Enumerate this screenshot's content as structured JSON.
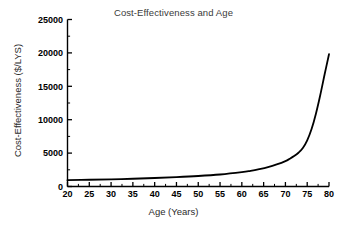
{
  "chart_data": {
    "type": "line",
    "title": "Cost-Effectiveness and Age",
    "xlabel": "Age (Years)",
    "ylabel": "Cost-Effectiveness ($/LYS)",
    "xlim": [
      20,
      80
    ],
    "ylim": [
      0,
      25000
    ],
    "xticks": [
      20,
      25,
      30,
      35,
      40,
      45,
      50,
      55,
      60,
      65,
      70,
      75,
      80
    ],
    "xtick_labels": [
      "20",
      "25",
      "30",
      "35",
      "40",
      "45",
      "50",
      "55",
      "60",
      "65",
      "70",
      "75",
      "80"
    ],
    "yticks": [
      0,
      5000,
      10000,
      15000,
      20000,
      25000
    ],
    "ytick_labels": [
      "0",
      "5000",
      "10000",
      "15000",
      "20000",
      "25000"
    ],
    "x_minor_interval": 2.5,
    "y_minor_interval": 2500,
    "grid": false,
    "legend": null,
    "spines": [
      "left",
      "bottom"
    ],
    "tick_direction": "in",
    "series": [
      {
        "name": "Cost-Effectiveness",
        "color": "#000000",
        "line_width": 1.8,
        "x": [
          20,
          25,
          30,
          35,
          40,
          45,
          50,
          55,
          60,
          62,
          64,
          66,
          68,
          70,
          71,
          72,
          73,
          74,
          75,
          76,
          77,
          78,
          79,
          80
        ],
        "y": [
          950,
          1010,
          1080,
          1160,
          1270,
          1400,
          1570,
          1800,
          2150,
          2350,
          2600,
          2900,
          3300,
          3800,
          4150,
          4550,
          5050,
          5750,
          6900,
          8600,
          10900,
          13700,
          16800,
          19800
        ]
      }
    ]
  }
}
